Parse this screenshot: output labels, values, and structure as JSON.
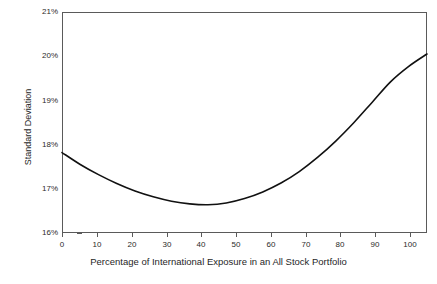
{
  "chart_data": {
    "type": "line",
    "title": "",
    "xlabel": "Percentage of International Exposure in an All Stock Portfolio",
    "ylabel": "Standard Deviation",
    "xlim": [
      0,
      100
    ],
    "ylim": [
      16,
      21
    ],
    "grid": false,
    "legend": null,
    "x_ticks": [
      0,
      10,
      20,
      30,
      40,
      50,
      60,
      70,
      80,
      90,
      100
    ],
    "x_tick_labels": [
      "0",
      "10",
      "20",
      "30",
      "40",
      "50",
      "60",
      "70",
      "80",
      "90",
      "100"
    ],
    "y_ticks": [
      16,
      17,
      18,
      19,
      20,
      21
    ],
    "y_tick_labels": [
      "16%",
      "17%",
      "18%",
      "19%",
      "20%",
      "21%"
    ],
    "series": [
      {
        "name": "Portfolio Standard Deviation",
        "color": "#111111",
        "x": [
          0,
          5,
          10,
          15,
          20,
          25,
          30,
          35,
          40,
          45,
          50,
          55,
          60,
          65,
          70,
          75,
          80,
          85,
          90,
          95,
          100
        ],
        "values": [
          17.82,
          17.55,
          17.32,
          17.12,
          16.95,
          16.82,
          16.72,
          16.66,
          16.64,
          16.68,
          16.78,
          16.93,
          17.13,
          17.39,
          17.71,
          18.08,
          18.5,
          18.96,
          19.42,
          19.77,
          20.05
        ]
      }
    ],
    "annotations": []
  },
  "axis": {
    "y_title": "Standard Deviation",
    "x_title": "Percentage of International Exposure in an All Stock Portfolio"
  }
}
